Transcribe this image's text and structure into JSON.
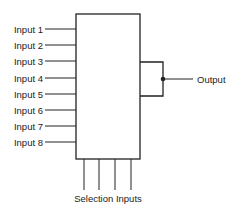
{
  "diagram": {
    "type": "multiplexer-block-diagram",
    "inputs": [
      {
        "label": "Input 1",
        "y": 29
      },
      {
        "label": "Input 2",
        "y": 45
      },
      {
        "label": "Input 3",
        "y": 61
      },
      {
        "label": "Input 4",
        "y": 78
      },
      {
        "label": "Input 5",
        "y": 94
      },
      {
        "label": "Input 6",
        "y": 110
      },
      {
        "label": "Input 7",
        "y": 126
      },
      {
        "label": "Input 8",
        "y": 142
      }
    ],
    "output": {
      "label": "Output"
    },
    "selection": {
      "label": "Selection Inputs",
      "line_count": 4,
      "line_x": [
        84,
        99,
        115,
        131
      ]
    },
    "colors": {
      "line": "#222222",
      "text": "#222222",
      "background": "#ffffff"
    }
  }
}
